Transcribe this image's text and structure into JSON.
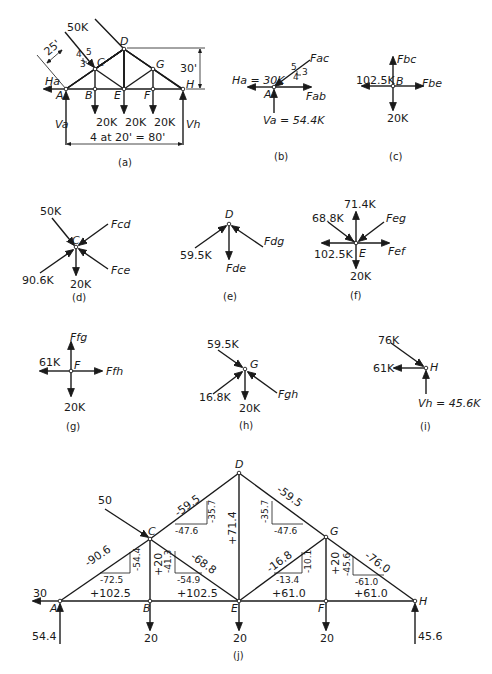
{
  "panels": {
    "a": {
      "caption": "(a)",
      "load_top": "50K",
      "dim_slant": "25'",
      "slope": {
        "a": "4",
        "b": "5",
        "c": "3"
      },
      "height": "30'",
      "span": "4 at 20' = 80'",
      "reactions": {
        "Ha": "Ha",
        "Va": "Va",
        "Vh": "Vh"
      },
      "loads": [
        "20K",
        "20K",
        "20K"
      ],
      "nodes": [
        "A",
        "B",
        "C",
        "D",
        "E",
        "F",
        "G",
        "H"
      ]
    },
    "b": {
      "caption": "(b)",
      "node": "A",
      "Ha": "Ha = 30K",
      "Va": "Va = 54.4K",
      "Fac": "Fac",
      "Fab": "Fab",
      "slope": {
        "h": "5",
        "v": "3",
        "b": "4"
      }
    },
    "c": {
      "caption": "(c)",
      "node": "B",
      "left": "102.5K",
      "Fbc": "Fbc",
      "Fbe": "Fbe",
      "down": "20K"
    },
    "d": {
      "caption": "(d)",
      "node": "C",
      "load": "50K",
      "Fcd": "Fcd",
      "Fce": "Fce",
      "left": "90.6K",
      "down": "20K"
    },
    "e": {
      "caption": "(e)",
      "node": "D",
      "left": "59.5K",
      "Fde": "Fde",
      "Fdg": "Fdg"
    },
    "f": {
      "caption": "(f)",
      "node": "E",
      "up": "71.4K",
      "ul": "68.8K",
      "Feg": "Feg",
      "left": "102.5K",
      "Fef": "Fef",
      "down": "20K"
    },
    "g": {
      "caption": "(g)",
      "node": "F",
      "Ffg": "Ffg",
      "left": "61K",
      "Ffh": "Ffh",
      "down": "20K"
    },
    "h": {
      "caption": "(h)",
      "node": "G",
      "ul": "59.5K",
      "ll": "16.8K",
      "down": "20K",
      "Fgh": "Fgh"
    },
    "i": {
      "caption": "(i)",
      "node": "H",
      "ul": "76K",
      "left": "61K",
      "Vh": "Vh = 45.6K"
    },
    "j": {
      "caption": "(j)",
      "nodes": [
        "A",
        "B",
        "C",
        "D",
        "E",
        "F",
        "G",
        "H"
      ],
      "loads": {
        "C": "50",
        "B": "20",
        "E": "20",
        "F": "20",
        "Ha": "30",
        "Va": "54.4",
        "Vh": "45.6"
      },
      "members": {
        "AC": "-90.6",
        "AC_h": "-72.5",
        "AC_v": "-54.4",
        "CD": "-59.5",
        "CD_h": "-47.6",
        "CD_v": "-35.7",
        "DG": "-59.5",
        "DG_h": "-47.6",
        "DG_v": "-35.7",
        "GH": "-76.0",
        "GH_h": "-61.0",
        "GH_v": "-45.6",
        "CE": "-68.8",
        "CE_h": "-54.9",
        "CE_v": "-41.3",
        "EG": "-16.8",
        "EG_h": "-13.4",
        "EG_v": "-10.1",
        "BC": "+20",
        "DE": "+71.4",
        "FG": "+20",
        "AB": "+102.5",
        "BE": "+102.5",
        "EF": "+61.0",
        "FH": "+61.0"
      }
    }
  }
}
